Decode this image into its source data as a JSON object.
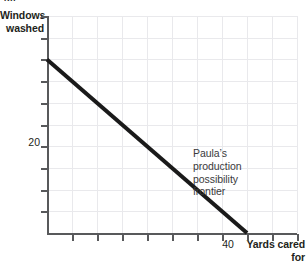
{
  "figure": {
    "crop_tag": "(b)"
  },
  "axes": {
    "y_title": "Windows\nwashed",
    "x_title": "Yards\ncared for",
    "y_tick_label": "20",
    "x_tick_label": "40"
  },
  "annotation": {
    "text": "Paula’s\nproduction\npossibility\nfrontier"
  },
  "colors": {
    "line": "#1a1a1a",
    "axis": "#58595b",
    "grid": "#e9e9ec",
    "text": "#231f20",
    "annotation_text": "#3a3a3c"
  },
  "chart_data": {
    "type": "line",
    "title": "",
    "subtitle": "",
    "xlabel": "Yards cared for",
    "ylabel": "Windows washed",
    "xlim": [
      0,
      50
    ],
    "ylim": [
      0,
      25
    ],
    "grid": true,
    "legend": "none",
    "xticks": [
      0,
      5,
      10,
      15,
      20,
      25,
      30,
      35,
      40,
      45,
      50
    ],
    "xtick_labels": [
      "",
      "",
      "",
      "",
      "",
      "",
      "",
      "",
      "40",
      "",
      ""
    ],
    "yticks": [
      0,
      2.5,
      5,
      7.5,
      10,
      12.5,
      15,
      17.5,
      20,
      22.5,
      25
    ],
    "ytick_labels": [
      "",
      "",
      "",
      "",
      "",
      "",
      "",
      "",
      "20",
      "",
      ""
    ],
    "series": [
      {
        "name": "Paula’s production possibility frontier",
        "x": [
          0,
          40
        ],
        "y": [
          20,
          0
        ],
        "color": "#1a1a1a",
        "linewidth": 4
      }
    ],
    "annotations": [
      {
        "text": "Paula’s production possibility frontier",
        "x": 20,
        "y": 13.5
      }
    ]
  }
}
